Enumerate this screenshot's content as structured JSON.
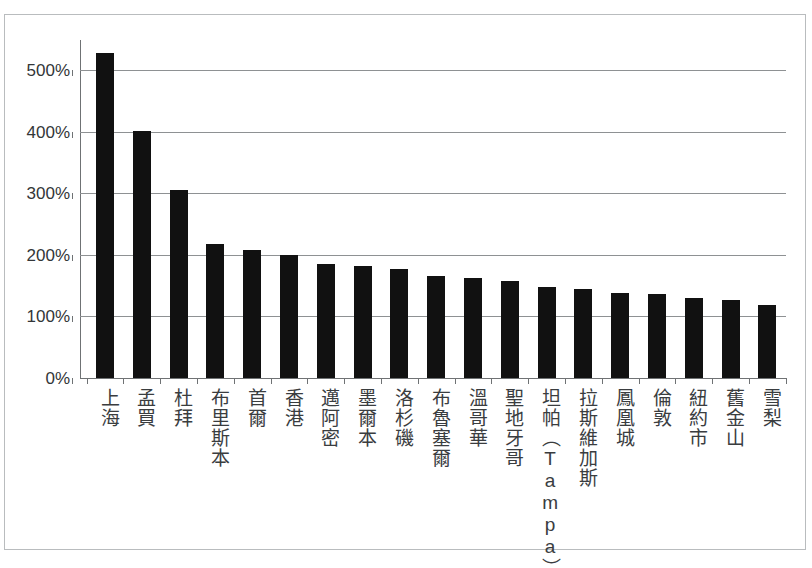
{
  "chart_data": {
    "type": "bar",
    "title": "",
    "subtitle": "",
    "xlabel": "",
    "ylabel": "",
    "ylim": [
      0,
      550
    ],
    "ytick_values": [
      0,
      100,
      200,
      300,
      400,
      500
    ],
    "ytick_labels": [
      "0%",
      "100%",
      "200%",
      "300%",
      "400%",
      "500%"
    ],
    "grid": true,
    "legend": false,
    "legend_position": "none",
    "orientation": "vertical",
    "bar_color": "#111111",
    "categories": [
      "上海",
      "孟買",
      "杜拜",
      "布里斯本",
      "首爾",
      "香港",
      "邁阿密",
      "墨爾本",
      "洛杉磯",
      "布魯塞爾",
      "溫哥華",
      "聖地牙哥",
      "坦帕（Tampa）",
      "拉斯維加斯",
      "鳳凰城",
      "倫敦",
      "紐約市",
      "舊金山",
      "雪梨"
    ],
    "values": [
      528,
      401,
      305,
      218,
      208,
      200,
      185,
      182,
      177,
      166,
      163,
      158,
      147,
      144,
      138,
      137,
      130,
      127,
      118
    ],
    "value_unit": "%"
  },
  "axes": {
    "y_tick_labels": [
      "500%",
      "400%",
      "300%",
      "200%",
      "100%",
      "0%"
    ]
  },
  "colors": {
    "bar": "#111111",
    "gridline": "#8e9193",
    "axis": "#6f7274",
    "frame": "#b9bcbe",
    "text": "#3a3d3f",
    "background": "#ffffff"
  }
}
